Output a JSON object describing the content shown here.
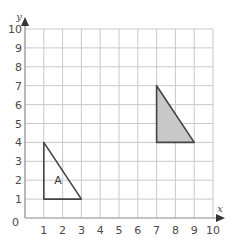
{
  "diagram": {
    "type": "coordinate-grid",
    "x_axis": {
      "label": "x",
      "min": 0,
      "max": 10,
      "ticks": [
        "1",
        "2",
        "3",
        "4",
        "5",
        "6",
        "7",
        "8",
        "9",
        "10"
      ]
    },
    "y_axis": {
      "label": "y",
      "min": 0,
      "max": 10,
      "ticks": [
        "1",
        "2",
        "3",
        "4",
        "5",
        "6",
        "7",
        "8",
        "9",
        "10"
      ]
    },
    "origin_label": "0",
    "shapes": [
      {
        "name": "triangle-a",
        "label": "A",
        "vertices": [
          [
            1,
            4
          ],
          [
            1,
            1
          ],
          [
            3,
            1
          ]
        ],
        "fill": "none",
        "label_pos": [
          1.75,
          2
        ]
      },
      {
        "name": "triangle-shaded",
        "label": "",
        "vertices": [
          [
            7,
            7
          ],
          [
            7,
            4
          ],
          [
            9,
            4
          ]
        ],
        "fill": "#c8c8c8"
      }
    ],
    "colors": {
      "grid": "#c9c9c9",
      "axis": "#8a8a8a",
      "outline": "#444444",
      "text": "#4a4a4a"
    }
  }
}
